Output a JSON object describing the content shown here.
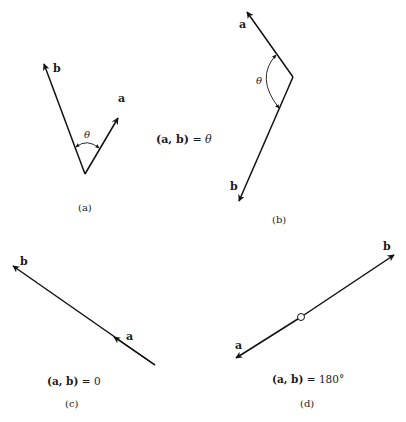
{
  "figure": {
    "panels": [
      {
        "id": "a",
        "caption": "(a)",
        "vectors": [
          {
            "name": "b",
            "label": "b"
          },
          {
            "name": "a",
            "label": "a"
          }
        ],
        "angle_label": "θ"
      },
      {
        "id": "b",
        "caption": "(b)",
        "vectors": [
          {
            "name": "a",
            "label": "a"
          },
          {
            "name": "b",
            "label": "b"
          }
        ],
        "angle_label": "θ"
      },
      {
        "id": "c",
        "caption": "(c)",
        "vectors": [
          {
            "name": "b",
            "label": "b"
          },
          {
            "name": "a",
            "label": "a"
          }
        ],
        "equation": {
          "lhs": "(a, b)",
          "eq": " = ",
          "rhs": "0"
        }
      },
      {
        "id": "d",
        "caption": "(d)",
        "vectors": [
          {
            "name": "b",
            "label": "b"
          },
          {
            "name": "a",
            "label": "a"
          }
        ],
        "equation": {
          "lhs": "(a, b)",
          "eq": " = ",
          "rhs": "180°"
        }
      }
    ],
    "middle_equation": {
      "lhs": "(a, b)",
      "eq": " = ",
      "rhs": "θ"
    }
  }
}
